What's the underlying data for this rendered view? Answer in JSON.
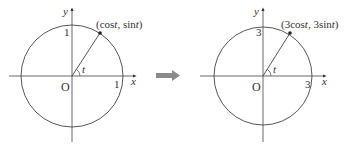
{
  "left": {
    "axis_x_label": "x",
    "axis_y_label": "y",
    "origin_label": "O",
    "x_tick": "1",
    "y_tick": "1",
    "angle_label": "t",
    "point_label": {
      "open": "(cos",
      "t1": "t",
      "mid": ", sin",
      "t2": "t",
      "close": ")"
    }
  },
  "arrow": {
    "color": "#8a8a8a"
  },
  "right": {
    "axis_x_label": "x",
    "axis_y_label": "y",
    "origin_label": "O",
    "x_tick": "3",
    "y_tick": "3",
    "angle_label": "t",
    "point_label": {
      "open": "(3cos",
      "t1": "t",
      "mid": ", 3sin",
      "t2": "t",
      "close": ")"
    }
  }
}
